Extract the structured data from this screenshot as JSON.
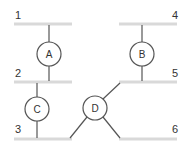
{
  "diagram": {
    "type": "bus-node-network",
    "buses": [
      {
        "id": "1",
        "label": "1"
      },
      {
        "id": "2",
        "label": "2"
      },
      {
        "id": "3",
        "label": "3"
      },
      {
        "id": "4",
        "label": "4"
      },
      {
        "id": "5",
        "label": "5"
      },
      {
        "id": "6",
        "label": "6"
      }
    ],
    "nodes": [
      {
        "id": "A",
        "label": "A",
        "connects": [
          "1",
          "2"
        ]
      },
      {
        "id": "B",
        "label": "B",
        "connects": [
          "4",
          "5"
        ]
      },
      {
        "id": "C",
        "label": "C",
        "connects": [
          "2",
          "3"
        ]
      },
      {
        "id": "D",
        "label": "D",
        "connects": [
          "5",
          "3",
          "6"
        ]
      }
    ],
    "colors": {
      "bus": "#d9d9d9",
      "wire": "#555555",
      "text": "#333333"
    }
  }
}
